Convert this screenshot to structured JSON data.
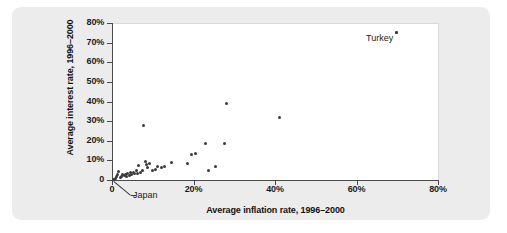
{
  "chart_data": {
    "type": "scatter",
    "title": "",
    "xlabel": "Average inflation rate, 1996–2000",
    "ylabel": "Average interest rate, 1996–2000",
    "xlim": [
      0,
      80
    ],
    "ylim": [
      0,
      80
    ],
    "xticks": [
      "0",
      "20%",
      "40%",
      "60%",
      "80%"
    ],
    "xtick_values": [
      0,
      20,
      40,
      60,
      80
    ],
    "yticks": [
      "0",
      "10%",
      "20%",
      "30%",
      "40%",
      "50%",
      "60%",
      "70%",
      "80%"
    ],
    "ytick_values": [
      0,
      10,
      20,
      30,
      40,
      50,
      60,
      70,
      80
    ],
    "grid": false,
    "legend": "none",
    "series": [
      {
        "name": "Countries",
        "points": [
          [
            0.3,
            0.5
          ],
          [
            0.8,
            1.0
          ],
          [
            1.0,
            1.8
          ],
          [
            1.3,
            2.6
          ],
          [
            1.6,
            4.2
          ],
          [
            2.0,
            1.4
          ],
          [
            2.4,
            2.0
          ],
          [
            2.6,
            3.0
          ],
          [
            3.0,
            2.2
          ],
          [
            3.3,
            2.8
          ],
          [
            3.6,
            1.9
          ],
          [
            3.9,
            3.2
          ],
          [
            4.2,
            2.4
          ],
          [
            4.5,
            3.6
          ],
          [
            4.8,
            2.7
          ],
          [
            5.2,
            4.0
          ],
          [
            5.6,
            3.1
          ],
          [
            6.0,
            4.6
          ],
          [
            6.3,
            3.3
          ],
          [
            6.6,
            7.2
          ],
          [
            7.0,
            3.8
          ],
          [
            7.4,
            5.0
          ],
          [
            7.8,
            28.0
          ],
          [
            8.2,
            9.4
          ],
          [
            8.5,
            7.8
          ],
          [
            8.8,
            6.6
          ],
          [
            9.2,
            8.2
          ],
          [
            10.0,
            4.6
          ],
          [
            10.6,
            5.6
          ],
          [
            11.2,
            6.8
          ],
          [
            12.2,
            6.2
          ],
          [
            13.0,
            6.8
          ],
          [
            14.5,
            8.8
          ],
          [
            18.6,
            8.6
          ],
          [
            19.6,
            12.8
          ],
          [
            20.4,
            13.4
          ],
          [
            23.0,
            18.8
          ],
          [
            23.6,
            5.0
          ],
          [
            25.4,
            7.0
          ],
          [
            27.6,
            18.6
          ],
          [
            28.0,
            39.2
          ],
          [
            41.2,
            32.0
          ],
          [
            69.8,
            75.0
          ]
        ]
      }
    ],
    "annotations": [
      {
        "label": "Turkey",
        "x": 69.8,
        "y": 75.0
      },
      {
        "label": "Japan",
        "x": 0.3,
        "y": 0.5
      }
    ]
  }
}
